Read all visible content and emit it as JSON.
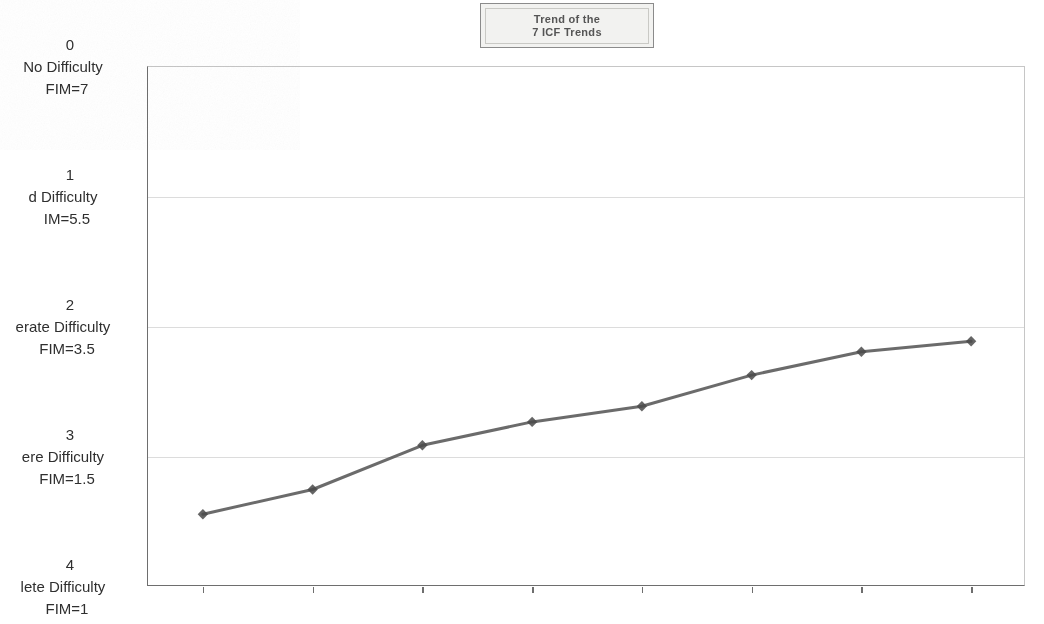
{
  "title": {
    "line1": "Trend of the",
    "line2": "7 ICF Trends"
  },
  "chart_data": {
    "type": "line",
    "title": "Trend of the 7 ICF Trends",
    "xlabel": "",
    "ylabel": "",
    "grid": true,
    "legend": false,
    "series_color": "#4a4a4a",
    "marker": "diamond",
    "x": [
      "May-06",
      "Nov-06",
      "May-07",
      "Nov-07",
      "May-08",
      "Nov-08",
      "May-09",
      "Nov-09"
    ],
    "categories": [
      "May-06",
      "Nov-06",
      "May-07",
      "Nov-07",
      "May-08",
      "Nov-08",
      "May-09",
      "Nov-09"
    ],
    "values": [
      3.44,
      3.25,
      2.91,
      2.73,
      2.61,
      2.37,
      2.19,
      2.11
    ],
    "ylim": [
      0,
      4
    ],
    "y_inverted": true,
    "y_tick_values": [
      0,
      1,
      2,
      3,
      4
    ],
    "y_tick_labels": [
      {
        "num": "0",
        "desc": "No Difficulty",
        "fim": "FIM=7",
        "full": "0 No Difficulty FIM=7"
      },
      {
        "num": "1",
        "desc": "d Difficulty",
        "fim": "IM=5.5",
        "full": "1 Mild Difficulty FIM=5.5"
      },
      {
        "num": "2",
        "desc": "erate Difficulty",
        "fim": "FIM=3.5",
        "full": "2 Moderate Difficulty FIM=3.5"
      },
      {
        "num": "3",
        "desc": "ere Difficulty",
        "fim": "FIM=1.5",
        "full": "3 Severe Difficulty FIM=1.5"
      },
      {
        "num": "4",
        "desc": "lete  Difficulty",
        "fim": "FIM=1",
        "full": "4 Complete Difficulty FIM=1"
      }
    ],
    "series": [
      {
        "name": "7 ICF Trends",
        "values": [
          3.44,
          3.25,
          2.91,
          2.73,
          2.61,
          2.37,
          2.19,
          2.11
        ]
      }
    ]
  },
  "x_labels": [
    "May-06",
    "Nov-06",
    "May-07",
    "Nov-07",
    "May-08",
    "Nov-08",
    "May-09",
    "Nov-09"
  ]
}
